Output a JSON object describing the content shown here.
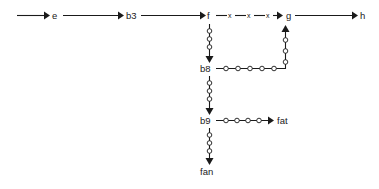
{
  "diagram": {
    "type": "flow-graph",
    "background_color": "#ffffff",
    "line_color": "#1a1a1a",
    "bead_fill_color": "#ffffff",
    "nodes": [
      {
        "id": "e",
        "label": "e",
        "x": 53,
        "y": 18
      },
      {
        "id": "b3",
        "label": "b3",
        "x": 127,
        "y": 18
      },
      {
        "id": "f",
        "label": "f",
        "x": 208,
        "y": 18
      },
      {
        "id": "g",
        "label": "g",
        "x": 287,
        "y": 18
      },
      {
        "id": "h",
        "label": "h",
        "x": 361,
        "y": 18
      },
      {
        "id": "b8",
        "label": "b8",
        "x": 201,
        "y": 70
      },
      {
        "id": "b9",
        "label": "b9",
        "x": 201,
        "y": 122
      },
      {
        "id": "fat",
        "label": "fat",
        "x": 278,
        "y": 122
      },
      {
        "id": "fan",
        "label": "fan",
        "x": 201,
        "y": 172
      }
    ],
    "edges": [
      {
        "id": "start-to-e",
        "from": "",
        "to": "e",
        "style": "solid",
        "beads": 0,
        "arrow": true,
        "orientation": "horizontal"
      },
      {
        "id": "e-to-b3",
        "from": "e",
        "to": "b3",
        "style": "solid",
        "beads": 0,
        "arrow": true,
        "orientation": "horizontal"
      },
      {
        "id": "b3-to-f",
        "from": "b3",
        "to": "f",
        "style": "solid",
        "beads": 0,
        "arrow": true,
        "orientation": "horizontal"
      },
      {
        "id": "f-to-g",
        "from": "f",
        "to": "g",
        "style": "dashed",
        "beads": 0,
        "arrow": true,
        "orientation": "horizontal",
        "labels": [
          "x",
          "x",
          "x"
        ]
      },
      {
        "id": "g-to-h",
        "from": "g",
        "to": "h",
        "style": "solid",
        "beads": 0,
        "arrow": true,
        "orientation": "horizontal"
      },
      {
        "id": "f-to-b8",
        "from": "f",
        "to": "b8",
        "style": "beaded",
        "beads": 3,
        "arrow": true,
        "orientation": "vertical"
      },
      {
        "id": "b8-to-g",
        "from": "b8",
        "to": "g",
        "style": "beaded",
        "beads": 8,
        "arrow": true,
        "orientation": "elbow-up-right"
      },
      {
        "id": "b8-to-b9",
        "from": "b8",
        "to": "b9",
        "style": "beaded",
        "beads": 3,
        "arrow": true,
        "orientation": "vertical"
      },
      {
        "id": "b9-to-fat",
        "from": "b9",
        "to": "fat",
        "style": "beaded",
        "beads": 4,
        "arrow": true,
        "orientation": "horizontal"
      },
      {
        "id": "b9-to-fan",
        "from": "b9",
        "to": "fan",
        "style": "beaded",
        "beads": 3,
        "arrow": true,
        "orientation": "vertical"
      }
    ],
    "edge_labels": {
      "f_to_g": [
        "x",
        "x",
        "x"
      ]
    }
  }
}
